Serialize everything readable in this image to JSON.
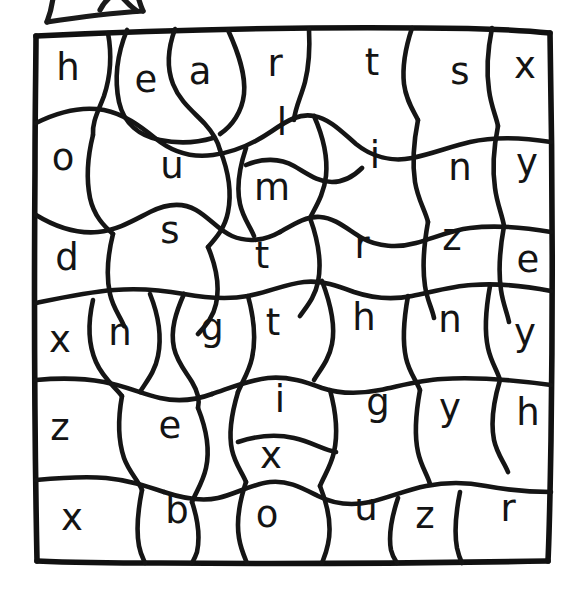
{
  "page": {
    "kind": "color-by-letter-worksheet",
    "title": "Color By Letter Puzzle Grid",
    "background_color": "#ffffff",
    "ink_color": "#141414"
  },
  "ornament": {
    "name": "cut-off-banner-shape",
    "description": "partial hand-drawn banner fragment cropped at top edge"
  },
  "grid": {
    "border_color": "#111111",
    "left": 35,
    "top": 32,
    "right": 551,
    "bottom": 563,
    "rows": 7,
    "columns": 7
  },
  "letters": [
    {
      "id": "c01",
      "char": "h",
      "x": 68,
      "y": 80
    },
    {
      "id": "c02",
      "char": "e",
      "x": 146,
      "y": 92
    },
    {
      "id": "c03",
      "char": "a",
      "x": 200,
      "y": 84
    },
    {
      "id": "c04",
      "char": "r",
      "x": 275,
      "y": 76
    },
    {
      "id": "c05",
      "char": "t",
      "x": 372,
      "y": 75
    },
    {
      "id": "c06",
      "char": "s",
      "x": 460,
      "y": 84
    },
    {
      "id": "c07",
      "char": "x",
      "x": 525,
      "y": 78
    },
    {
      "id": "c08",
      "char": "o",
      "x": 63,
      "y": 170
    },
    {
      "id": "c09",
      "char": "u",
      "x": 172,
      "y": 178
    },
    {
      "id": "c10",
      "char": "l",
      "x": 282,
      "y": 135
    },
    {
      "id": "c11",
      "char": "i",
      "x": 375,
      "y": 168
    },
    {
      "id": "c12",
      "char": "n",
      "x": 460,
      "y": 180
    },
    {
      "id": "c13",
      "char": "y",
      "x": 527,
      "y": 175
    },
    {
      "id": "c14",
      "char": "m",
      "x": 272,
      "y": 200
    },
    {
      "id": "c15",
      "char": "s",
      "x": 170,
      "y": 243
    },
    {
      "id": "c16",
      "char": "d",
      "x": 67,
      "y": 270
    },
    {
      "id": "c17",
      "char": "t",
      "x": 262,
      "y": 268
    },
    {
      "id": "c18",
      "char": "r",
      "x": 362,
      "y": 258
    },
    {
      "id": "c19",
      "char": "z",
      "x": 452,
      "y": 250
    },
    {
      "id": "c20",
      "char": "e",
      "x": 528,
      "y": 272
    },
    {
      "id": "c21",
      "char": "x",
      "x": 60,
      "y": 352
    },
    {
      "id": "c22",
      "char": "n",
      "x": 120,
      "y": 345
    },
    {
      "id": "c23",
      "char": "g",
      "x": 212,
      "y": 340
    },
    {
      "id": "c24",
      "char": "t",
      "x": 273,
      "y": 335
    },
    {
      "id": "c25",
      "char": "h",
      "x": 364,
      "y": 330
    },
    {
      "id": "c26",
      "char": "n",
      "x": 450,
      "y": 332
    },
    {
      "id": "c27",
      "char": "y",
      "x": 525,
      "y": 345
    },
    {
      "id": "c28",
      "char": "z",
      "x": 60,
      "y": 440
    },
    {
      "id": "c29",
      "char": "e",
      "x": 170,
      "y": 438
    },
    {
      "id": "c30",
      "char": "i",
      "x": 280,
      "y": 412
    },
    {
      "id": "c31",
      "char": "g",
      "x": 378,
      "y": 415
    },
    {
      "id": "c32",
      "char": "y",
      "x": 450,
      "y": 420
    },
    {
      "id": "c33",
      "char": "h",
      "x": 528,
      "y": 425
    },
    {
      "id": "c34",
      "char": "x",
      "x": 271,
      "y": 468
    },
    {
      "id": "c35",
      "char": "x",
      "x": 72,
      "y": 530
    },
    {
      "id": "c36",
      "char": "b",
      "x": 177,
      "y": 523
    },
    {
      "id": "c37",
      "char": "o",
      "x": 267,
      "y": 527
    },
    {
      "id": "c38",
      "char": "u",
      "x": 366,
      "y": 520
    },
    {
      "id": "c39",
      "char": "z",
      "x": 425,
      "y": 528
    },
    {
      "id": "c40",
      "char": "r",
      "x": 508,
      "y": 521
    }
  ],
  "hidden_word": "heart"
}
